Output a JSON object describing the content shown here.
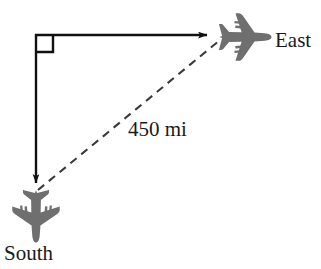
{
  "figure": {
    "background_color": "#ffffff",
    "width": 321,
    "height": 269
  },
  "labels": {
    "east": "East",
    "south": "South",
    "distance": "450 mi"
  },
  "colors": {
    "line": "#111111",
    "dashed_line": "#3a3a3a",
    "airplane": "#6f6f6f",
    "text": "#1a1a1a"
  },
  "geometry": {
    "corner": {
      "x": 36,
      "y": 35
    },
    "east_endpoint": {
      "x": 216,
      "y": 35
    },
    "south_endpoint": {
      "x": 36,
      "y": 192
    },
    "right_angle_marker_size": 17,
    "dash_pattern": "8 6"
  },
  "icons": {
    "airplane_east": "airplane-icon",
    "airplane_south": "airplane-icon",
    "right_angle": "right-angle-marker-icon",
    "arrow_east": "arrow-east-icon",
    "arrow_south": "arrow-south-icon",
    "hypotenuse": "dashed-hypotenuse-icon"
  }
}
